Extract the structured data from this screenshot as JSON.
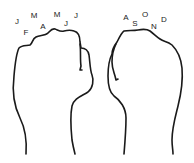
{
  "figure": {
    "stroke_color": "#1a1a1a",
    "label_color": "#222222",
    "left_fist": {
      "months": [
        {
          "label": "J",
          "x": 17,
          "y": 22
        },
        {
          "label": "F",
          "x": 26,
          "y": 33
        },
        {
          "label": "M",
          "x": 34,
          "y": 16
        },
        {
          "label": "A",
          "x": 43,
          "y": 27
        },
        {
          "label": "M",
          "x": 57,
          "y": 15
        },
        {
          "label": "J",
          "x": 66,
          "y": 24
        },
        {
          "label": "J",
          "x": 76,
          "y": 16
        }
      ]
    },
    "right_fist": {
      "months": [
        {
          "label": "A",
          "x": 126,
          "y": 18
        },
        {
          "label": "S",
          "x": 135,
          "y": 24
        },
        {
          "label": "O",
          "x": 145,
          "y": 15
        },
        {
          "label": "N",
          "x": 154,
          "y": 27
        },
        {
          "label": "D",
          "x": 164,
          "y": 20
        }
      ]
    }
  }
}
